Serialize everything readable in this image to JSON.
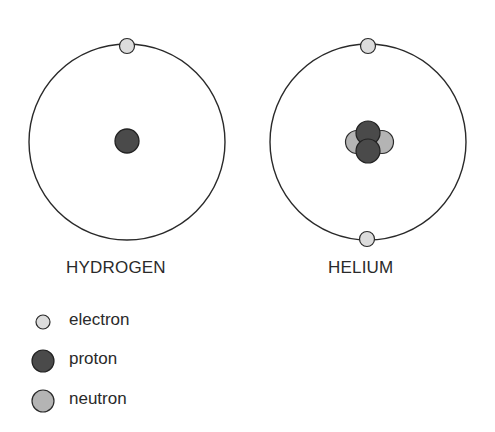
{
  "atoms": [
    {
      "name": "HYDROGEN",
      "protons": 1,
      "neutrons": 0,
      "electrons": 1
    },
    {
      "name": "HELIUM",
      "protons": 2,
      "neutrons": 2,
      "electrons": 2
    }
  ],
  "legend": [
    {
      "label": "electron",
      "color": "#dcdcdc"
    },
    {
      "label": "proton",
      "color": "#4a4a4a"
    },
    {
      "label": "neutron",
      "color": "#b4b4b4"
    }
  ],
  "colors": {
    "orbit": "#2a2a2a",
    "electron": "#dcdcdc",
    "proton": "#4a4a4a",
    "neutron": "#b4b4b4",
    "outline": "#2a2a2a"
  }
}
